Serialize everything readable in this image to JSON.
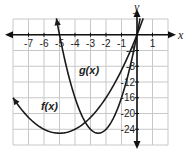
{
  "chart_data": {
    "type": "line",
    "title": "",
    "xlabel": "x",
    "ylabel": "y",
    "xlim": [
      -8,
      2
    ],
    "ylim": [
      -28,
      4
    ],
    "grid": true,
    "x_grid_step": 1,
    "y_grid_step": 4,
    "x_tick_labels": [
      "-7",
      "-6",
      "-5",
      "-4",
      "-3",
      "-2",
      "-1",
      "1"
    ],
    "x_ticks": [
      -7,
      -6,
      -5,
      -4,
      -3,
      -2,
      -1,
      1
    ],
    "y_tick_labels": [
      "-4",
      "-8",
      "-12",
      "-16",
      "-20",
      "-24"
    ],
    "y_ticks": [
      -4,
      -8,
      -12,
      -16,
      -20,
      -24
    ],
    "series": [
      {
        "name": "f(x)",
        "label": "f(x)",
        "equation": "x^2 + 10x",
        "vertex": [
          -5,
          -25
        ],
        "x_range": [
          -8,
          0.4
        ],
        "x": [
          -8,
          -7,
          -6,
          -5,
          -4,
          -3,
          -2,
          -1,
          0
        ],
        "y": [
          -16,
          -21,
          -24,
          -25,
          -24,
          -21,
          -16,
          -9,
          0
        ],
        "label_pos": [
          -6.2,
          -19
        ]
      },
      {
        "name": "g(x)",
        "label": "g(x)",
        "equation": "4x^2 + 20x",
        "vertex": [
          -2.5,
          -25
        ],
        "x_range": [
          -5.2,
          0.2
        ],
        "x": [
          -5,
          -4,
          -3,
          -2.5,
          -2,
          -1,
          0
        ],
        "y": [
          0,
          -16,
          -24,
          -25,
          -24,
          -16,
          0
        ],
        "label_pos": [
          -3.75,
          -10
        ]
      }
    ],
    "colors": {
      "curve": "#1a1a1a",
      "axis": "#111111",
      "grid": "#c8c8c8"
    }
  }
}
